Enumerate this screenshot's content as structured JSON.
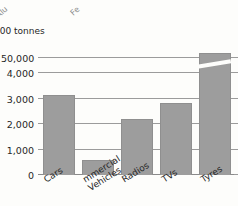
{
  "page": {
    "cut_fragments": [
      {
        "text": "Alu",
        "note": "cut-off rotated label from chart above"
      },
      {
        "text": "Fe",
        "note": "cut-off rotated label from chart above"
      }
    ]
  },
  "chart_data": {
    "type": "bar",
    "title": "",
    "subtitle": "",
    "ylabel": "000 tonnes",
    "xlabel": "",
    "categories": [
      "Cars",
      "mmercial Vehicles",
      "Radios",
      "TVs",
      "Tyres"
    ],
    "values": [
      3100,
      550,
      2150,
      2800,
      50000
    ],
    "ytick_labels": [
      "0",
      "1,000",
      "2,000",
      "3,000",
      "4,000",
      "50,000"
    ],
    "ytick_values": [
      0,
      1000,
      2000,
      3000,
      4000,
      50000
    ],
    "ylim": [
      0,
      50000
    ],
    "broken_axis": true,
    "break_between": [
      4000,
      50000
    ],
    "grid": true,
    "legend": "none",
    "bar_color": "#9d9d9d",
    "grid_color": "#9b9b9b",
    "background_color": "#fdfdfb"
  }
}
